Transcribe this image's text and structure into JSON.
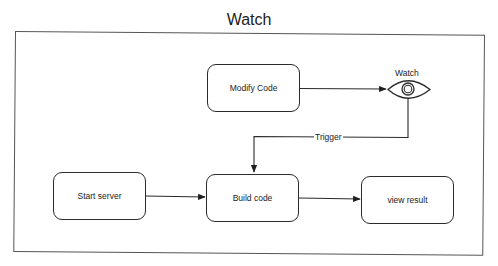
{
  "diagram": {
    "title": "Watch",
    "colors": {
      "stroke": "#2b2b2b",
      "frame": "#555555",
      "background": "#ffffff",
      "text": "#222222"
    },
    "nodes": [
      {
        "id": "modify-code",
        "label": "Modify Code",
        "shape": "rounded-rect"
      },
      {
        "id": "watch",
        "label": "Watch",
        "shape": "eye-icon"
      },
      {
        "id": "start-server",
        "label": "Start server",
        "shape": "rounded-rect"
      },
      {
        "id": "build-code",
        "label": "Build code",
        "shape": "rounded-rect"
      },
      {
        "id": "view-result",
        "label": "view result",
        "shape": "rounded-rect"
      }
    ],
    "edges": [
      {
        "from": "modify-code",
        "to": "watch",
        "label": ""
      },
      {
        "from": "watch",
        "to": "build-code",
        "label": "Trigger"
      },
      {
        "from": "start-server",
        "to": "build-code",
        "label": ""
      },
      {
        "from": "build-code",
        "to": "view-result",
        "label": ""
      }
    ],
    "caption": ""
  }
}
